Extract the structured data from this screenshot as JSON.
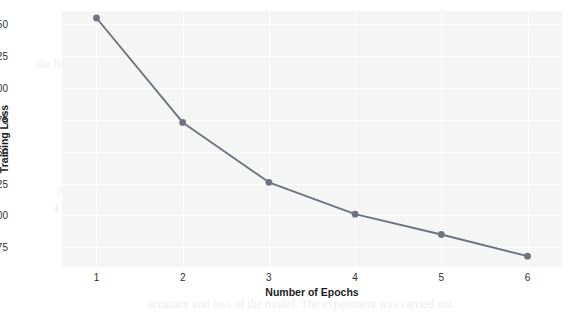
{
  "chart_data": {
    "type": "line",
    "title": "",
    "xlabel": "Number of Epochs",
    "ylabel": "Training Loss",
    "x": [
      1,
      2,
      3,
      4,
      5,
      6
    ],
    "values": [
      0.655,
      0.573,
      0.526,
      0.501,
      0.485,
      0.468
    ],
    "series": [
      {
        "name": "Training Loss",
        "values": [
          0.655,
          0.573,
          0.526,
          0.501,
          0.485,
          0.468
        ]
      }
    ],
    "xtick_labels": [
      "1",
      "2",
      "3",
      "4",
      "5",
      "6"
    ],
    "ytick_labels": [
      "0.475",
      "0.500",
      "0.525",
      "0.550",
      "0.575",
      "0.600",
      "0.625",
      "0.650"
    ],
    "ytick_values": [
      0.475,
      0.5,
      0.525,
      0.55,
      0.575,
      0.6,
      0.625,
      0.65
    ],
    "xlim": [
      0.6,
      6.4
    ],
    "ylim": [
      0.4595,
      0.6605
    ],
    "grid": true,
    "legend": false,
    "legend_position": "none",
    "marker": "circle",
    "line_color": "#6d7480",
    "marker_color": "#6d7480",
    "plot_background": "#f5f5f5",
    "grid_color": "#ffffff",
    "figure_background": "#ffffff"
  },
  "background_text": {
    "note": "faint bleed-through text from reverse side of scanned page",
    "lines": [
      "computed in a step-wise manner while modeling and learning the parameters",
      "accuracy and loss of the model. The experiment was carried out",
      "the parameter tuning, the accuracy and the loss value of the model",
      "presented in the next section. The results are summarized in the table",
      "4. Although the overall results indicate a comparable performance across",
      "the benchmark datasets, the proposed approach shows consistent gains"
    ]
  }
}
